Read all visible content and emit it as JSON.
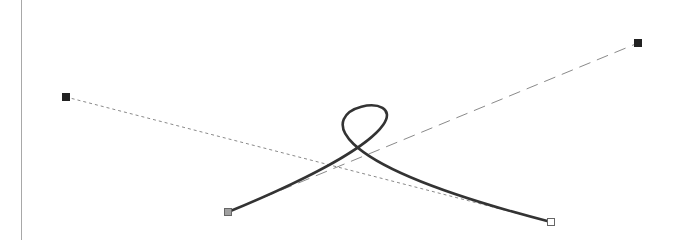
{
  "editor": {
    "colors": {
      "background": "#ffffff",
      "divider": "#a8a8a8",
      "curve": "#333333",
      "handle_line": "#888888",
      "control_point": "#222222",
      "start_anchor_fill": "#a0a0a0",
      "end_anchor_fill": "#ffffff",
      "anchor_stroke": "#666666"
    },
    "curve": {
      "type": "cubic-bezier",
      "start": {
        "x": 228,
        "y": 212
      },
      "control1": {
        "x": 638,
        "y": 43
      },
      "control2": {
        "x": 66,
        "y": 97
      },
      "end": {
        "x": 551,
        "y": 222
      }
    }
  }
}
